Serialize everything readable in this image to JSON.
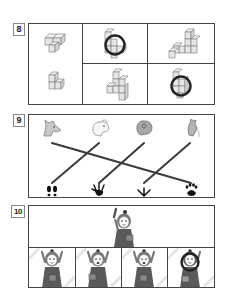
{
  "questions": [
    {
      "number": "8",
      "type": "cube-figures",
      "cells": [
        {
          "id": "left-top",
          "label": "cube-shape-flat-l"
        },
        {
          "id": "left-bottom",
          "label": "cube-shape-step"
        },
        {
          "id": "mid-top",
          "label": "cube-shape-tower",
          "circled": true
        },
        {
          "id": "right-top",
          "label": "cube-shape-stairs"
        },
        {
          "id": "mid-bottom",
          "label": "cube-shape-pyramid"
        },
        {
          "id": "right-bottom",
          "label": "cube-shape-small-tower",
          "circled": true
        }
      ]
    },
    {
      "number": "9",
      "type": "match-animals-to-footprints",
      "animals": [
        "wolf",
        "dog",
        "frog",
        "rooster"
      ],
      "footprints": [
        "hoof-print",
        "frog-print",
        "bird-print",
        "paw-print"
      ],
      "connections": [
        {
          "from": 0,
          "to": 3
        },
        {
          "from": 1,
          "to": 0
        },
        {
          "from": 2,
          "to": 1
        },
        {
          "from": 3,
          "to": 2
        }
      ]
    },
    {
      "number": "10",
      "type": "find-the-different-picture",
      "reference": "girl-waving",
      "options": [
        {
          "label": "girl-option-1"
        },
        {
          "label": "girl-option-2"
        },
        {
          "label": "girl-option-3"
        },
        {
          "label": "girl-option-4",
          "circled": true
        }
      ]
    }
  ],
  "colors": {
    "border": "#444444",
    "line": "#3a3a3a",
    "circle": "#222222",
    "dress": "#5a5a5a"
  }
}
